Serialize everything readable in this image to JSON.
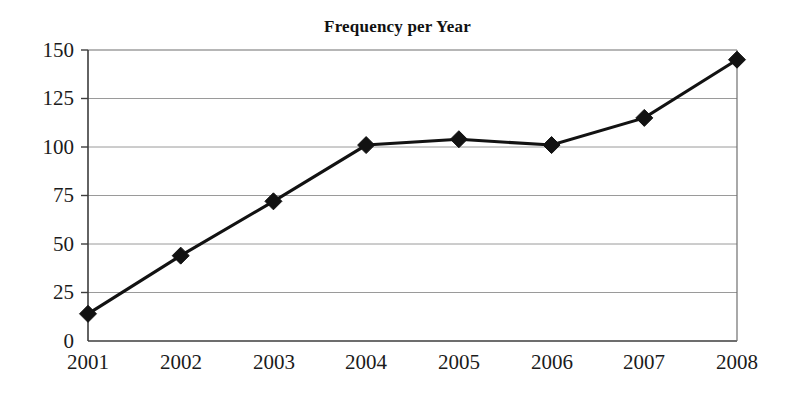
{
  "chart_data": {
    "type": "line",
    "title": "Frequency per Year",
    "xlabel": "",
    "ylabel": "",
    "categories": [
      "2001",
      "2002",
      "2003",
      "2004",
      "2005",
      "2006",
      "2007",
      "2008"
    ],
    "values": [
      14,
      44,
      72,
      101,
      104,
      101,
      115,
      145
    ],
    "series": [
      {
        "name": "Frequency",
        "values": [
          14,
          44,
          72,
          101,
          104,
          101,
          115,
          145
        ]
      }
    ],
    "x": [
      2001,
      2002,
      2003,
      2004,
      2005,
      2006,
      2007,
      2008
    ],
    "ylim": [
      0,
      150
    ],
    "yticks": [
      0,
      25,
      50,
      75,
      100,
      125,
      150
    ],
    "ytick_labels": [
      "0",
      "25",
      "50",
      "75",
      "100",
      "125",
      "150"
    ],
    "xtick_labels": [
      "2001",
      "2002",
      "2003",
      "2004",
      "2005",
      "2006",
      "2007",
      "2008"
    ],
    "grid": "horizontal",
    "legend": "none",
    "marker": "diamond",
    "line_color": "#121212",
    "marker_color": "#121212",
    "grid_color": "#9a9a9a",
    "axis_color": "#4a4a4a",
    "background_color": "#ffffff"
  },
  "labels": {
    "title": "Frequency per Year",
    "y_0": "0",
    "y_25": "25",
    "y_50": "50",
    "y_75": "75",
    "y_100": "100",
    "y_125": "125",
    "y_150": "150",
    "x_2001": "2001",
    "x_2002": "2002",
    "x_2003": "2003",
    "x_2004": "2004",
    "x_2005": "2005",
    "x_2006": "2006",
    "x_2007": "2007",
    "x_2008": "2008"
  }
}
